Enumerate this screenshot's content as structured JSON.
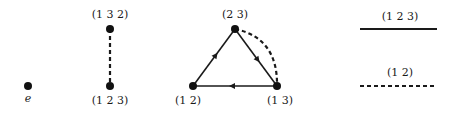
{
  "graphs": {
    "identity": {
      "nodes": [
        {
          "id": "e",
          "label": "e"
        }
      ]
    },
    "cycle3": {
      "nodes": [
        {
          "id": "132",
          "label": "(1 3 2)"
        },
        {
          "id": "123",
          "label": "(1 2 3)"
        }
      ],
      "edges": [
        {
          "from": "132",
          "to": "123",
          "style": "dashed"
        }
      ]
    },
    "transpositions": {
      "nodes": [
        {
          "id": "23",
          "label": "(2 3)"
        },
        {
          "id": "12",
          "label": "(1 2)"
        },
        {
          "id": "13",
          "label": "(1 3)"
        }
      ],
      "edges": [
        {
          "from": "12",
          "to": "23",
          "style": "solid",
          "directed": true
        },
        {
          "from": "23",
          "to": "13",
          "style": "solid",
          "directed": true
        },
        {
          "from": "13",
          "to": "12",
          "style": "solid",
          "directed": true
        },
        {
          "from": "23",
          "to": "13",
          "style": "dashed",
          "directed": false
        }
      ]
    }
  },
  "legend": [
    {
      "label": "(1 2 3)",
      "style": "solid"
    },
    {
      "label": "(1 2)",
      "style": "dashed"
    }
  ]
}
